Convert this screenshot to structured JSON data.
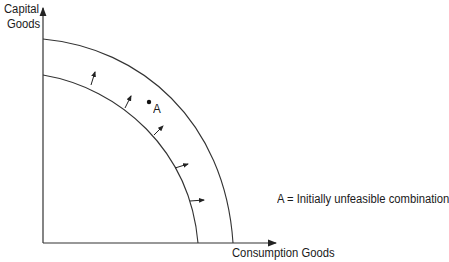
{
  "diagram": {
    "y_axis_label_line1": "Capital",
    "y_axis_label_line2": "Goods",
    "x_axis_label": "Consumption Goods",
    "point_label": "A",
    "legend_text": "A = Initially unfeasible combination",
    "curves": [
      {
        "name": "original PPF",
        "y_intercept_px": 75,
        "x_intercept_px": 198
      },
      {
        "name": "expanded PPF",
        "y_intercept_px": 39,
        "x_intercept_px": 233
      }
    ],
    "shift_arrows": 5,
    "line_color": "#333333"
  }
}
